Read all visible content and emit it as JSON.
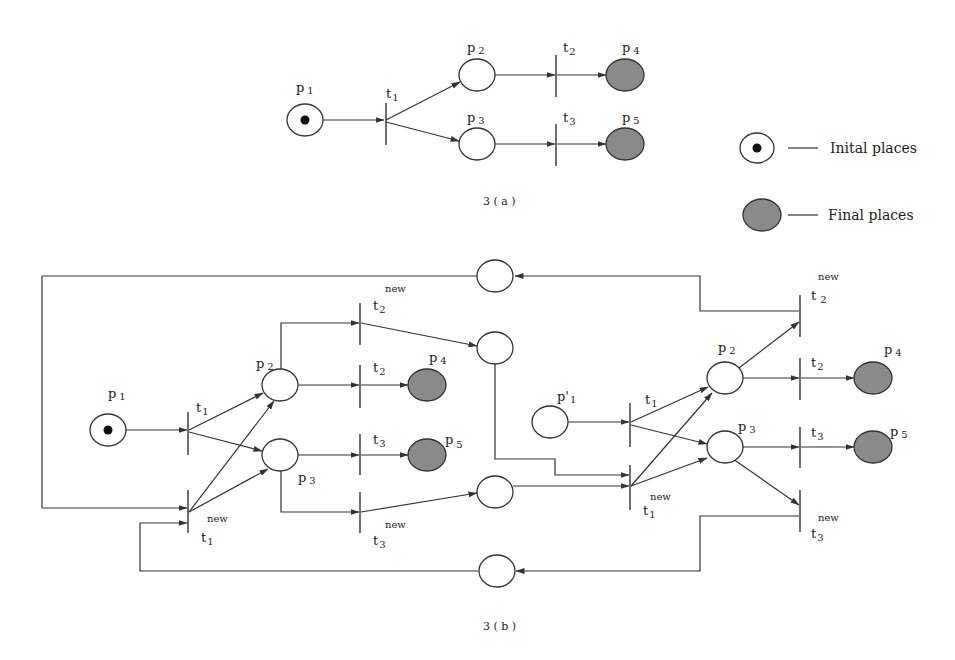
{
  "figure_a": {
    "caption": "3 ( a )",
    "places": {
      "p1": {
        "letter": "p",
        "sub": "1",
        "type": "initial"
      },
      "p2": {
        "letter": "p",
        "sub": "2",
        "type": "normal"
      },
      "p3": {
        "letter": "p",
        "sub": "3",
        "type": "normal"
      },
      "p4": {
        "letter": "p",
        "sub": "4",
        "type": "final"
      },
      "p5": {
        "letter": "p",
        "sub": "5",
        "type": "final"
      }
    },
    "transitions": {
      "t1": {
        "letter": "t",
        "sub": "1"
      },
      "t2": {
        "letter": "t",
        "sub": "2"
      },
      "t3": {
        "letter": "t",
        "sub": "3"
      }
    },
    "arcs": [
      [
        "p1",
        "t1"
      ],
      [
        "t1",
        "p2"
      ],
      [
        "t1",
        "p3"
      ],
      [
        "p2",
        "t2"
      ],
      [
        "t2",
        "p4"
      ],
      [
        "p3",
        "t3"
      ],
      [
        "t3",
        "p5"
      ]
    ]
  },
  "legend": {
    "initial": {
      "label": "Inital places",
      "dash": "—"
    },
    "final": {
      "label": "Final places",
      "dash": "—"
    }
  },
  "figure_b": {
    "caption": "3 ( b )",
    "new_label": "new",
    "left": {
      "p1": {
        "letter": "p",
        "sub": "1"
      },
      "p2": {
        "letter": "p",
        "sub": "2"
      },
      "p3": {
        "letter": "p",
        "sub": "3"
      },
      "p4": {
        "letter": "p",
        "sub": "4"
      },
      "p5": {
        "letter": "p",
        "sub": "5"
      },
      "t1": {
        "letter": "t",
        "sub": "1"
      },
      "t1new": {
        "letter": "t",
        "sub": "1"
      },
      "t2": {
        "letter": "t",
        "sub": "2"
      },
      "t2new": {
        "letter": "t",
        "sub": "2"
      },
      "t3": {
        "letter": "t",
        "sub": "3"
      },
      "t3new": {
        "letter": "t",
        "sub": "3"
      }
    },
    "right": {
      "p1prime": {
        "letter": "p'",
        "sub": "1"
      },
      "p2": {
        "letter": "p",
        "sub": "2"
      },
      "p3": {
        "letter": "p",
        "sub": "3"
      },
      "p4": {
        "letter": "p",
        "sub": "4"
      },
      "p5": {
        "letter": "p",
        "sub": "5"
      },
      "t1": {
        "letter": "t",
        "sub": "1"
      },
      "t1new": {
        "letter": "t",
        "sub": "1"
      },
      "t2": {
        "letter": "t",
        "sub": "2"
      },
      "t2new": {
        "letter": "t",
        "sub": "2"
      },
      "t3": {
        "letter": "t",
        "sub": "3"
      },
      "t3new": {
        "letter": "t",
        "sub": "3"
      }
    },
    "colors": {
      "final_fill": "#8a8a8a",
      "token": "#111111",
      "stroke": "#333333"
    }
  }
}
